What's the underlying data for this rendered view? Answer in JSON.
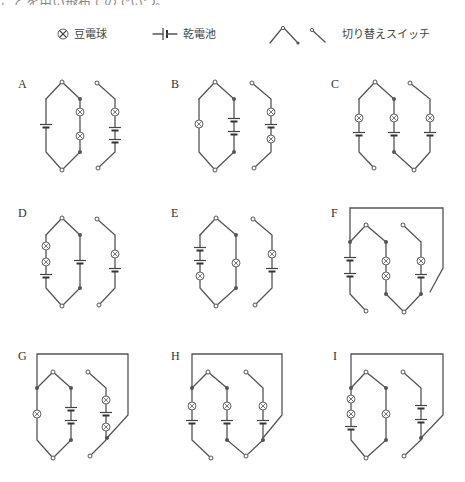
{
  "header": {
    "cut_text": "ことを用い飛布てのでいつ。"
  },
  "legend": {
    "bulb_label": "豆電球",
    "battery_label": "乾電池",
    "switch_label": "切り替えスイッチ",
    "icons": [
      "bulb-icon",
      "battery-icon",
      "switch-pivot-icon",
      "switch-lever-icon"
    ]
  },
  "colors": {
    "wire": "#555555",
    "background": "#ffffff",
    "text": "#333333"
  },
  "circuits": [
    {
      "label": "A",
      "lx": 18,
      "ly": 88,
      "pivot": [
        62,
        82
      ],
      "bottom": [
        62,
        170
      ],
      "top_y": 99,
      "bot_y": 152,
      "frame": null,
      "branches": [
        {
          "x": 46,
          "role": "left",
          "items": [
            {
              "t": "battery",
              "y": 126
            }
          ]
        },
        {
          "x": 80,
          "role": "right",
          "dots": true,
          "items": [
            {
              "t": "bulb",
              "y": 112
            },
            {
              "t": "bulb",
              "y": 136
            }
          ]
        }
      ],
      "separate": {
        "x": 115,
        "top": [
          97,
          83
        ],
        "bottom": [
          98,
          168
        ],
        "items": [
          {
            "t": "bulb",
            "y": 112
          },
          {
            "t": "battery",
            "y": 129
          },
          {
            "t": "battery",
            "y": 141
          }
        ]
      }
    },
    {
      "label": "B",
      "lx": 171,
      "ly": 88,
      "pivot": [
        215,
        82
      ],
      "bottom": [
        215,
        170
      ],
      "top_y": 99,
      "bot_y": 152,
      "frame": null,
      "branches": [
        {
          "x": 199,
          "role": "left",
          "items": [
            {
              "t": "bulb",
              "y": 124
            }
          ]
        },
        {
          "x": 234,
          "role": "right",
          "dots": true,
          "items": [
            {
              "t": "battery",
              "y": 120
            },
            {
              "t": "battery",
              "y": 133
            }
          ]
        }
      ],
      "separate": {
        "x": 271,
        "top": [
          252,
          83
        ],
        "bottom": [
          254,
          168
        ],
        "items": [
          {
            "t": "bulb",
            "y": 112
          },
          {
            "t": "battery",
            "y": 126
          },
          {
            "t": "bulb",
            "y": 139
          }
        ]
      }
    },
    {
      "label": "C",
      "lx": 331,
      "ly": 88,
      "pivot": [
        375,
        82
      ],
      "bottom": [
        414,
        170
      ],
      "top_y": 99,
      "bot_y": 152,
      "frame": null,
      "type": "c",
      "branches": [
        {
          "x": 359,
          "role": "left-open",
          "open": [
            374,
            168
          ],
          "items": [
            {
              "t": "bulb",
              "y": 118
            },
            {
              "t": "battery",
              "y": 134
            }
          ]
        },
        {
          "x": 394,
          "role": "mid",
          "dots": true,
          "items": [
            {
              "t": "bulb",
              "y": 118
            },
            {
              "t": "battery",
              "y": 134
            }
          ]
        },
        {
          "x": 430,
          "role": "right-open-top",
          "open": [
            410,
            83
          ],
          "items": [
            {
              "t": "bulb",
              "y": 118
            },
            {
              "t": "battery",
              "y": 134
            }
          ]
        }
      ]
    },
    {
      "label": "D",
      "lx": 18,
      "ly": 217,
      "pivot": [
        62,
        218
      ],
      "bottom": [
        62,
        306
      ],
      "top_y": 235,
      "bot_y": 288,
      "frame": null,
      "branches": [
        {
          "x": 46,
          "role": "left",
          "items": [
            {
              "t": "bulb",
              "y": 246
            },
            {
              "t": "bulb",
              "y": 262
            },
            {
              "t": "battery",
              "y": 276
            }
          ]
        },
        {
          "x": 80,
          "role": "right",
          "dots": true,
          "items": [
            {
              "t": "battery",
              "y": 262
            }
          ]
        }
      ],
      "separate": {
        "x": 115,
        "top": [
          97,
          219
        ],
        "bottom": [
          99,
          305
        ],
        "items": [
          {
            "t": "bulb",
            "y": 254
          },
          {
            "t": "battery",
            "y": 270
          }
        ]
      }
    },
    {
      "label": "E",
      "lx": 171,
      "ly": 217,
      "pivot": [
        216,
        218
      ],
      "bottom": [
        216,
        306
      ],
      "top_y": 235,
      "bot_y": 288,
      "frame": null,
      "branches": [
        {
          "x": 200,
          "role": "left",
          "items": [
            {
              "t": "battery",
              "y": 249
            },
            {
              "t": "battery",
              "y": 262
            },
            {
              "t": "bulb",
              "y": 276
            }
          ]
        },
        {
          "x": 236,
          "role": "right",
          "dots": true,
          "items": [
            {
              "t": "bulb",
              "y": 263
            }
          ]
        }
      ],
      "separate": {
        "x": 272,
        "top": [
          253,
          219
        ],
        "bottom": [
          255,
          305
        ],
        "items": [
          {
            "t": "bulb",
            "y": 254
          },
          {
            "t": "battery",
            "y": 270
          }
        ]
      }
    },
    {
      "label": "F",
      "lx": 331,
      "ly": 217,
      "pivot": [
        366,
        225
      ],
      "bottom": [
        404,
        312
      ],
      "top_y": 242,
      "bot_y": 294,
      "type": "c",
      "frame": {
        "left": 350,
        "top": 208,
        "right": 443,
        "right_down": 268,
        "end": [
          430,
          292
        ]
      },
      "branches": [
        {
          "x": 350,
          "role": "left-open",
          "dots_top": true,
          "open": [
            366,
            311
          ],
          "items": [
            {
              "t": "battery",
              "y": 259
            },
            {
              "t": "battery",
              "y": 275
            }
          ]
        },
        {
          "x": 386,
          "role": "mid",
          "dots": true,
          "items": [
            {
              "t": "bulb",
              "y": 261
            },
            {
              "t": "bulb",
              "y": 276
            }
          ]
        },
        {
          "x": 421,
          "role": "right-open-top",
          "open": [
            403,
            225
          ],
          "dot_bottom": true,
          "items": [
            {
              "t": "bulb",
              "y": 261
            },
            {
              "t": "battery",
              "y": 276
            }
          ]
        }
      ]
    },
    {
      "label": "G",
      "lx": 18,
      "ly": 360,
      "pivot": [
        53,
        372
      ],
      "bottom": [
        53,
        458
      ],
      "top_y": 388,
      "bot_y": 440,
      "frame": {
        "left": 37,
        "top": 354,
        "right": 128,
        "right_down": 415,
        "end": [
          107,
          438
        ]
      },
      "branches": [
        {
          "x": 37,
          "role": "left",
          "dots_top": true,
          "items": [
            {
              "t": "bulb",
              "y": 414
            }
          ]
        },
        {
          "x": 71,
          "role": "right",
          "dots": true,
          "items": [
            {
              "t": "battery",
              "y": 409
            },
            {
              "t": "battery",
              "y": 422
            }
          ]
        }
      ],
      "separate": {
        "x": 106,
        "top": [
          88,
          372
        ],
        "bottom": [
          90,
          456
        ],
        "dot_join": [
          107,
          438
        ],
        "items": [
          {
            "t": "bulb",
            "y": 400
          },
          {
            "t": "battery",
            "y": 414
          },
          {
            "t": "bulb",
            "y": 427
          }
        ]
      }
    },
    {
      "label": "H",
      "lx": 171,
      "ly": 360,
      "pivot": [
        208,
        372
      ],
      "bottom": [
        246,
        456
      ],
      "top_y": 388,
      "bot_y": 440,
      "type": "c",
      "frame": {
        "left": 192,
        "top": 354,
        "right": 282,
        "right_down": 415,
        "end": [
          263,
          438
        ]
      },
      "branches": [
        {
          "x": 192,
          "role": "left-open",
          "dots_top": true,
          "open": [
            211,
            458
          ],
          "items": [
            {
              "t": "bulb",
              "y": 406
            },
            {
              "t": "battery",
              "y": 422
            }
          ]
        },
        {
          "x": 227,
          "role": "mid",
          "dots": true,
          "items": [
            {
              "t": "bulb",
              "y": 406
            },
            {
              "t": "battery",
              "y": 422
            }
          ]
        },
        {
          "x": 263,
          "role": "right-open-top",
          "open": [
            246,
            372
          ],
          "dot_bottom": true,
          "items": [
            {
              "t": "bulb",
              "y": 406
            },
            {
              "t": "battery",
              "y": 422
            }
          ]
        }
      ]
    },
    {
      "label": "I",
      "lx": 333,
      "ly": 360,
      "pivot": [
        366,
        372
      ],
      "bottom": [
        366,
        458
      ],
      "top_y": 388,
      "bot_y": 440,
      "frame": {
        "left": 351,
        "top": 354,
        "right": 443,
        "right_down": 415,
        "end": [
          421,
          438
        ]
      },
      "branches": [
        {
          "x": 351,
          "role": "left",
          "dots_top": true,
          "items": [
            {
              "t": "bulb",
              "y": 399
            },
            {
              "t": "bulb",
              "y": 414
            },
            {
              "t": "battery",
              "y": 428
            }
          ]
        },
        {
          "x": 386,
          "role": "right",
          "dots": true,
          "items": [
            {
              "t": "bulb",
              "y": 414
            }
          ]
        }
      ],
      "separate": {
        "x": 421,
        "top": [
          403,
          372
        ],
        "bottom": [
          404,
          456
        ],
        "dot_join": [
          421,
          438
        ],
        "items": [
          {
            "t": "battery",
            "y": 407
          },
          {
            "t": "battery",
            "y": 421
          }
        ]
      }
    }
  ]
}
